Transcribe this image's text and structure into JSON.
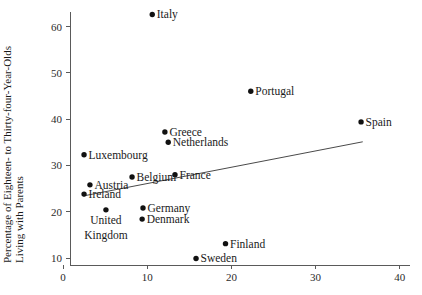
{
  "chart_data": {
    "type": "scatter",
    "title": "",
    "xlabel": "",
    "ylabel": "Percentage of Eighteen- to Thirty-four-Year-Olds Living with Parents",
    "ylabel_line1": "Percentage of Eighteen- to Thirty-four-Year-Olds",
    "ylabel_line2": "Living with Parents",
    "xlim": [
      -1.5,
      42
    ],
    "ylim": [
      8.5,
      64
    ],
    "grid": false,
    "legend": "none",
    "xticks": [
      0,
      10,
      20,
      30,
      40
    ],
    "xtick_labels": [
      "0",
      "10",
      "20",
      "30",
      "40"
    ],
    "yticks": [
      10,
      20,
      30,
      40,
      50,
      60
    ],
    "ytick_labels": [
      "10",
      "20",
      "30",
      "40",
      "50",
      "60"
    ],
    "points": [
      {
        "label": "Italy",
        "x": 10.6,
        "y": 62.6,
        "label_side": "right"
      },
      {
        "label": "Portugal",
        "x": 22.3,
        "y": 46.0,
        "label_side": "right"
      },
      {
        "label": "Spain",
        "x": 35.4,
        "y": 39.4,
        "label_side": "right"
      },
      {
        "label": "Greece",
        "x": 12.1,
        "y": 37.2,
        "label_side": "right"
      },
      {
        "label": "Netherlands",
        "x": 12.5,
        "y": 35.0,
        "label_side": "right"
      },
      {
        "label": "Luxembourg",
        "x": 2.5,
        "y": 32.3,
        "label_side": "right"
      },
      {
        "label": "France",
        "x": 13.3,
        "y": 28.0,
        "label_side": "right"
      },
      {
        "label": "Belgium",
        "x": 8.2,
        "y": 27.5,
        "label_side": "right"
      },
      {
        "label": "Austria",
        "x": 3.2,
        "y": 25.8,
        "label_side": "right"
      },
      {
        "label": "Ireland",
        "x": 2.5,
        "y": 23.8,
        "label_side": "right"
      },
      {
        "label": "Germany",
        "x": 9.5,
        "y": 20.8,
        "label_side": "right"
      },
      {
        "label": "United Kingdom",
        "x": 5.1,
        "y": 20.4,
        "label_side": "below"
      },
      {
        "label": "Denmark",
        "x": 9.4,
        "y": 18.4,
        "label_side": "right"
      },
      {
        "label": "Finland",
        "x": 19.3,
        "y": 13.1,
        "label_side": "right"
      },
      {
        "label": "Sweden",
        "x": 15.8,
        "y": 9.9,
        "label_side": "right"
      }
    ],
    "trend_line": {
      "name": "fitted regression line",
      "x_start": 2.4,
      "y_start": 23.4,
      "x_end": 35.6,
      "y_end": 35.1
    },
    "colors": {
      "point": "#111111",
      "trend": "#4a4a4a",
      "axis": "#5a5a5a",
      "text": "#1a1a1a",
      "background": "#ffffff"
    }
  }
}
